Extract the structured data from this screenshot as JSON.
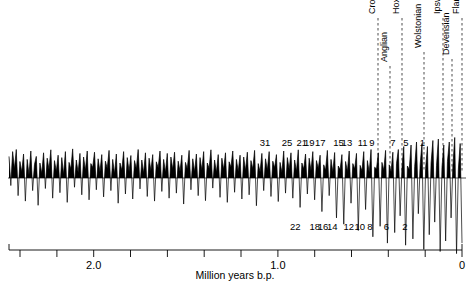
{
  "chart_data": {
    "type": "area",
    "title": "",
    "subtitle": "",
    "xlabel": "Million years b.p.",
    "ylabel": "",
    "xlim": [
      2.46,
      0.0
    ],
    "x_axis_direction": "reversed",
    "grid": false,
    "legend": null,
    "axis": {
      "tick_labels": [
        {
          "value": 2.0,
          "text": "2.0"
        },
        {
          "value": 1.0,
          "text": "1.0"
        },
        {
          "value": 0.0,
          "text": "0"
        }
      ],
      "minor_tick_interval": 0.2,
      "tick_values": [
        2.4,
        2.2,
        2.0,
        1.8,
        1.6,
        1.4,
        1.2,
        1.0,
        0.8,
        0.6,
        0.4,
        0.2,
        0.0
      ]
    },
    "baseline_note": "zero line; filled black above (interglacial/light isotope), thin line below (glacial)",
    "marine_isotope_stages_odd": [
      {
        "label": "31",
        "x": 1.07
      },
      {
        "label": "25",
        "x": 0.95
      },
      {
        "label": "21",
        "x": 0.87
      },
      {
        "label": "19",
        "x": 0.83
      },
      {
        "label": "17",
        "x": 0.77
      },
      {
        "label": "15",
        "x": 0.67
      },
      {
        "label": "13",
        "x": 0.625
      },
      {
        "label": "11",
        "x": 0.54
      },
      {
        "label": "9",
        "x": 0.49
      },
      {
        "label": "7",
        "x": 0.375
      },
      {
        "label": "5",
        "x": 0.305
      },
      {
        "label": "1",
        "x": 0.215
      }
    ],
    "marine_isotope_stages_even": [
      {
        "label": "22",
        "x": 0.905
      },
      {
        "label": "18",
        "x": 0.8
      },
      {
        "label": "16",
        "x": 0.755
      },
      {
        "label": "14",
        "x": 0.705
      },
      {
        "label": "12",
        "x": 0.615
      },
      {
        "label": "10",
        "x": 0.555
      },
      {
        "label": "8",
        "x": 0.5
      },
      {
        "label": "6",
        "x": 0.41
      },
      {
        "label": "2",
        "x": 0.31
      }
    ],
    "stage_boundaries": [
      {
        "name": "Cromerian",
        "x_px": 378,
        "label_top_px": 14
      },
      {
        "name": "Anglian",
        "x_px": 390,
        "label_top_px": 62
      },
      {
        "name": "Hoxnian",
        "x_px": 402,
        "label_top_px": 14
      },
      {
        "name": "Wolstonian",
        "x_px": 424,
        "label_top_px": 48
      },
      {
        "name": "Ipswichian",
        "x_px": 443,
        "label_top_px": 14
      },
      {
        "name": "Devensian",
        "x_px": 452,
        "label_top_px": 55
      },
      {
        "name": "Flandrian",
        "x_px": 462,
        "label_top_px": 14
      }
    ],
    "series": [
      {
        "name": "oxygen isotope ratio",
        "description": "benthic delta-18-O record, ~2.46 Ma to present",
        "values": [
          0.72,
          -0.18,
          0.88,
          0.3,
          0.95,
          -0.42,
          0.55,
          0.2,
          0.8,
          -0.55,
          0.62,
          0.1,
          0.9,
          -0.3,
          0.45,
          0.72,
          -0.65,
          0.5,
          0.15,
          0.84,
          -0.25,
          0.66,
          0.28,
          0.94,
          -0.48,
          0.58,
          0.22,
          0.76,
          -0.35,
          0.68,
          0.12,
          0.88,
          -0.58,
          0.52,
          0.3,
          0.97,
          -0.22,
          0.6,
          0.18,
          0.82,
          -0.4,
          0.7,
          0.25,
          0.9,
          -0.52,
          0.48,
          0.35,
          0.86,
          -0.28,
          0.64,
          0.2,
          0.78,
          -0.45,
          0.56,
          0.32,
          0.92,
          -0.3,
          0.62,
          0.14,
          0.8,
          -0.6,
          0.5,
          0.26,
          0.88,
          -0.38,
          0.68,
          0.22,
          0.75,
          -0.5,
          0.58,
          0.3,
          0.95,
          -0.26,
          0.6,
          0.16,
          0.84,
          -0.44,
          0.66,
          0.24,
          0.78,
          -0.55,
          0.54,
          0.34,
          0.9,
          -0.32,
          0.62,
          0.18,
          0.82,
          -0.48,
          0.7,
          0.28,
          0.86,
          -0.36,
          0.56,
          0.22,
          0.76,
          -0.62,
          0.52,
          0.3,
          0.92,
          -0.28,
          0.64,
          0.2,
          0.8,
          -0.42,
          0.68,
          0.26,
          0.88,
          -0.54,
          0.5,
          0.32,
          0.94,
          -0.24,
          0.6,
          0.18,
          0.78,
          -0.46,
          0.66,
          0.28,
          0.84,
          -0.58,
          0.54,
          0.36,
          0.9,
          -0.34,
          0.62,
          0.22,
          0.76,
          -0.5,
          0.7,
          0.24,
          0.86,
          -0.4,
          0.58,
          0.3,
          0.92,
          -0.66,
          0.48,
          0.2,
          0.82,
          -0.3,
          0.64,
          0.26,
          0.88,
          -0.44,
          0.56,
          0.34,
          0.78,
          -0.56,
          0.52,
          0.18,
          0.9,
          -0.36,
          0.68,
          0.28,
          0.84,
          -0.48,
          0.6,
          0.22,
          0.94,
          -0.7,
          0.5,
          0.3,
          0.8,
          -0.38,
          0.66,
          0.24,
          0.88,
          -0.52,
          0.58,
          0.32,
          0.76,
          -0.8,
          0.44,
          0.26,
          0.92,
          -0.42,
          0.62,
          0.2,
          0.85,
          -0.95,
          0.4,
          0.28,
          0.78,
          -1.1,
          0.55,
          0.22,
          0.9,
          -0.6,
          0.48,
          0.3,
          0.82,
          -1.25,
          0.42,
          0.24,
          0.88,
          -0.75,
          0.58,
          0.18,
          0.95,
          -1.4,
          0.36,
          0.3,
          0.84,
          -1.15,
          0.52,
          0.26,
          0.92,
          -1.55,
          0.44,
          0.2,
          0.86,
          -1.3,
          0.48,
          0.95,
          -0.9,
          0.34,
          1.05,
          -1.6,
          0.4,
          0.28,
          1.1,
          -1.45,
          0.38,
          1.2,
          -0.85,
          0.45,
          1.15,
          -1.7,
          0.32,
          1.05,
          -1.35,
          0.5,
          1.25,
          -1.05,
          0.42,
          1.3,
          -1.75,
          0.36,
          1.1,
          -1.5,
          0.55,
          1.2,
          -0.95,
          0.4,
          1.35,
          -1.8,
          0.3,
          1.15,
          -1.55
        ]
      }
    ]
  },
  "figure": {
    "caption": "",
    "axis_title": "Million years b.p."
  }
}
